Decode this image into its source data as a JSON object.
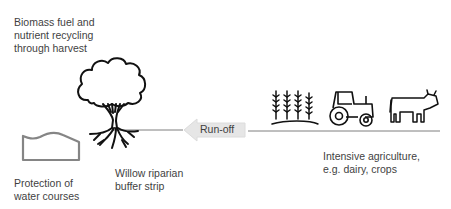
{
  "labels": {
    "biomass": [
      "Biomass fuel and",
      "nutrient recycling",
      "through harvest"
    ],
    "protection": [
      "Protection of",
      "water courses"
    ],
    "willow": [
      "Willow riparian",
      "buffer strip"
    ],
    "intensive": [
      "Intensive agriculture,",
      "e.g. dairy, crops"
    ]
  },
  "arrow": {
    "label": "Run-off",
    "direction": "left",
    "fill": "#e6e6e6"
  },
  "icons": [
    "water-course-icon",
    "tree-icon",
    "wheat-icon",
    "tractor-icon",
    "cow-icon"
  ],
  "colors": {
    "stroke": "#1a1a1a",
    "line": "#7f7f7f",
    "text": "#3f3f3f",
    "water": "#808080"
  }
}
